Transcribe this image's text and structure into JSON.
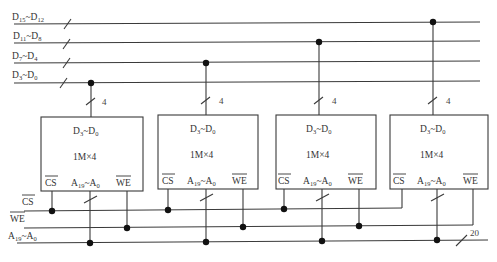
{
  "bus": {
    "data_lines": [
      {
        "label_main": "D",
        "sub1": "15",
        "sep": "~D",
        "sub2": "12"
      },
      {
        "label_main": "D",
        "sub1": "11",
        "sep": "~D",
        "sub2": "8"
      },
      {
        "label_main": "D",
        "sub1": "7",
        "sep": "~D",
        "sub2": "4"
      },
      {
        "label_main": "D",
        "sub1": "3",
        "sep": "~D",
        "sub2": "0"
      }
    ],
    "cs_label": "CS",
    "we_label": "WE",
    "addr_label": {
      "main": "A",
      "sub1": "19",
      "sep": "~A",
      "sub2": "0"
    },
    "addr_width": "20",
    "tap_width": "4"
  },
  "chips": [
    {
      "data_label": "D3~D0",
      "size": "1M×4",
      "cs": "CS",
      "addr": "A19~A0",
      "we": "WE"
    },
    {
      "data_label": "D3~D0",
      "size": "1M×4",
      "cs": "CS",
      "addr": "A19~A0",
      "we": "WE"
    },
    {
      "data_label": "D3~D0",
      "size": "1M×4",
      "cs": "CS",
      "addr": "A19~A0",
      "we": "WE"
    },
    {
      "data_label": "D3~D0",
      "size": "1M×4",
      "cs": "CS",
      "addr": "A19~A0",
      "we": "WE"
    }
  ],
  "chip_text": {
    "d": "D",
    "d_sub1": "3",
    "d_sep": "~D",
    "d_sub2": "0",
    "size": "1M×4",
    "cs": "CS",
    "a": "A",
    "a_sub1": "19",
    "a_sep": "~A",
    "a_sub2": "0",
    "we": "WE"
  }
}
